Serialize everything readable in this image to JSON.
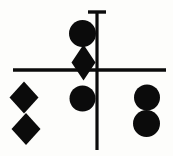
{
  "figure": {
    "canvas": {
      "width": 173,
      "height": 156
    },
    "background_color": "#fdfdfb",
    "ink_color": "#0b0b0b",
    "lines": [
      {
        "name": "vertical-axis-line",
        "orientation": "vertical",
        "x": 97,
        "y1": 11,
        "y2": 150,
        "thickness": 3.2
      },
      {
        "name": "horizontal-axis-line",
        "orientation": "horizontal",
        "y": 70,
        "x1": 13,
        "x2": 166,
        "thickness": 3.4
      },
      {
        "name": "top-cap-line",
        "orientation": "horizontal",
        "y": 12,
        "x1": 88,
        "x2": 106,
        "thickness": 3.4
      }
    ],
    "shapes": [
      {
        "name": "center-top-circle",
        "type": "circle",
        "cx": 82.5,
        "cy": 33.5,
        "r": 13.5,
        "column": "center",
        "order": 1
      },
      {
        "name": "center-middle-diamond",
        "type": "diamond",
        "cx": 83.5,
        "cy": 62.5,
        "half_width": 12,
        "half_height": 18,
        "column": "center",
        "order": 2
      },
      {
        "name": "center-bottom-circle",
        "type": "circle",
        "cx": 82.5,
        "cy": 98.5,
        "r": 13,
        "column": "center",
        "order": 3
      },
      {
        "name": "left-upper-diamond",
        "type": "diamond",
        "cx": 24,
        "cy": 97.5,
        "half_width": 14.5,
        "half_height": 16,
        "column": "left",
        "order": 1
      },
      {
        "name": "left-lower-diamond",
        "type": "diamond",
        "cx": 26,
        "cy": 129,
        "half_width": 14.5,
        "half_height": 16,
        "column": "left",
        "order": 2
      },
      {
        "name": "right-upper-circle",
        "type": "circle",
        "cx": 147,
        "cy": 97.5,
        "r": 13,
        "column": "right",
        "order": 1
      },
      {
        "name": "right-lower-circle",
        "type": "circle",
        "cx": 146.5,
        "cy": 123.5,
        "r": 13.5,
        "column": "right",
        "order": 2
      }
    ],
    "counts": {
      "circles": 4,
      "diamonds": 3,
      "lines": 3
    }
  }
}
